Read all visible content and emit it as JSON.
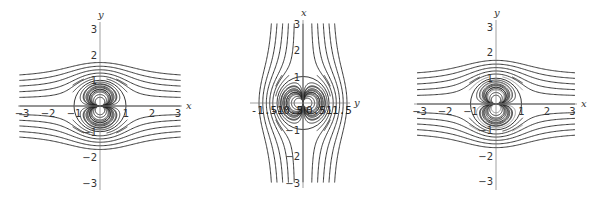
{
  "chart_data": [
    {
      "type": "line",
      "title": "",
      "description": "Streamlines of uniform flow past a doublet: psi = y - y/(x^2+y^2)",
      "xlabel": "x",
      "ylabel": "y",
      "xlim": [
        -3,
        3
      ],
      "ylim": [
        -3,
        3
      ],
      "xticks": [
        "−3",
        "−2",
        "−1",
        "1",
        "2",
        "3"
      ],
      "xtick_values": [
        -3,
        -2,
        -1,
        1,
        2,
        3
      ],
      "yticks": [
        "3",
        "2",
        "1",
        "−1",
        "−2",
        "−3"
      ],
      "ytick_values": [
        3,
        2,
        1,
        -1,
        -2,
        -3
      ],
      "stream_function": "y - y/(x^2+y^2)",
      "swap_axes": false,
      "outer_levels": [
        0.3,
        0.5,
        0.7,
        0.9,
        1.1,
        -0.3,
        -0.5,
        -0.7,
        -0.9,
        -1.1
      ],
      "inner_levels": [
        -0.15,
        -0.35,
        -0.6,
        -0.9,
        -1.3,
        -1.8,
        -2.6,
        0.15,
        0.35,
        0.6,
        0.9,
        1.3,
        1.8,
        2.6
      ],
      "zero_circle": true,
      "light_inner": false
    },
    {
      "type": "line",
      "title": "",
      "description": "Same streamlines with axes swapped (vertical axis x, horizontal axis y)",
      "xlabel": "y",
      "ylabel": "x",
      "xlim": [
        -1.85,
        1.85
      ],
      "ylim": [
        -3,
        3
      ],
      "xticks": [
        "-1.5",
        "-1",
        "-0.5",
        "0.5",
        "1",
        "1.5"
      ],
      "xtick_values": [
        -1.5,
        -1,
        -0.5,
        0.5,
        1,
        1.5
      ],
      "yticks": [
        "3",
        "2",
        "1",
        "−1",
        "−2",
        "−3"
      ],
      "ytick_values": [
        3,
        2,
        1,
        -1,
        -2,
        -3
      ],
      "stream_function": "y - y/(x^2+y^2)",
      "swap_axes": true,
      "outer_levels": [
        0.3,
        0.5,
        0.7,
        0.9,
        1.1,
        -0.3,
        -0.5,
        -0.7,
        -0.9,
        -1.1
      ],
      "inner_levels": [
        -0.15,
        -0.35,
        -0.6,
        -0.9,
        -1.3,
        -1.8,
        -2.6,
        0.15,
        0.35,
        0.6,
        0.9,
        1.3,
        1.8,
        2.6
      ],
      "zero_circle": true,
      "light_inner": false
    },
    {
      "type": "line",
      "title": "",
      "description": "Streamlines of uniform flow past a doublet, inner loops partly shaded lighter",
      "xlabel": "x",
      "ylabel": "y",
      "xlim": [
        -3,
        3
      ],
      "ylim": [
        -3,
        3
      ],
      "xticks": [
        "−3",
        "−2",
        "−1",
        "1",
        "2",
        "3"
      ],
      "xtick_values": [
        -3,
        -2,
        -1,
        1,
        2,
        3
      ],
      "yticks": [
        "3",
        "2",
        "1",
        "−1",
        "−2",
        "−3"
      ],
      "ytick_values": [
        3,
        2,
        1,
        -1,
        -2,
        -3
      ],
      "stream_function": "y - y/(x^2+y^2)",
      "swap_axes": false,
      "outer_levels": [
        0.3,
        0.5,
        0.7,
        0.9,
        1.1,
        -0.3,
        -0.5,
        -0.7,
        -0.9,
        -1.1
      ],
      "inner_levels": [
        -0.15,
        -0.35,
        -0.6,
        -0.9,
        -1.3,
        -1.8,
        -2.6,
        0.15,
        0.35,
        0.6,
        0.9,
        1.3,
        1.8,
        2.6
      ],
      "zero_circle": true,
      "light_inner": true
    }
  ]
}
